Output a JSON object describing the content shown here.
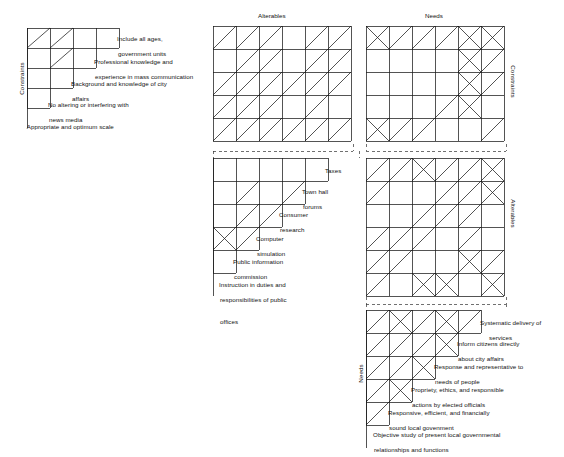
{
  "figure": {
    "type": "interaction-matrix-diagram",
    "title_top_middle": "Alterables",
    "title_top_right": "Needs"
  },
  "axis_labels": {
    "constraints_left": "Constraints",
    "constraints_right": "Constraints",
    "alterables_right": "Alterables",
    "needs_left": "Needs"
  },
  "blocks": {
    "constraints_self": {
      "name": "Constraints × Constraints",
      "shape": "staircase",
      "rows": 5,
      "cols": 4,
      "cell_w": 23,
      "cell_h": 20,
      "row_cell_counts": [
        4,
        3,
        2,
        1,
        0
      ],
      "marks": [
        {
          "row": 0,
          "col": 0,
          "type": "diagonal-up"
        },
        {
          "row": 0,
          "col": 1,
          "type": "diagonal-up"
        },
        {
          "row": 1,
          "col": 1,
          "type": "diagonal-up"
        }
      ],
      "labels": [
        {
          "line1": "Include all ages,",
          "line2": "government units"
        },
        {
          "line1": "Professional knowledge and",
          "line2": "experience in mass communication"
        },
        {
          "line1": "Background and knowledge of city",
          "line2": "affairs"
        },
        {
          "line1": "No altering or interfering with",
          "line2": "news media"
        },
        {
          "line1": "Appropriate and optimum scale",
          "line2": ""
        }
      ]
    },
    "alterables_by_constraints": {
      "name": "Alterables × Constraints",
      "shape": "full-grid",
      "rows": 5,
      "cols": 6,
      "cell_w": 23,
      "cell_h": 23,
      "marks": [
        {
          "row": 0,
          "col": 0,
          "type": "diagonal-up"
        },
        {
          "row": 0,
          "col": 1,
          "type": "diagonal-up"
        },
        {
          "row": 0,
          "col": 2,
          "type": "diagonal-up"
        },
        {
          "row": 0,
          "col": 4,
          "type": "diagonal-up"
        },
        {
          "row": 0,
          "col": 5,
          "type": "diagonal-up"
        },
        {
          "row": 1,
          "col": 1,
          "type": "diagonal-up"
        },
        {
          "row": 1,
          "col": 2,
          "type": "diagonal-up"
        },
        {
          "row": 1,
          "col": 4,
          "type": "diagonal-up"
        },
        {
          "row": 1,
          "col": 5,
          "type": "diagonal-up"
        },
        {
          "row": 2,
          "col": 0,
          "type": "diagonal-up"
        },
        {
          "row": 2,
          "col": 1,
          "type": "diagonal-up"
        },
        {
          "row": 2,
          "col": 2,
          "type": "diagonal-up"
        },
        {
          "row": 2,
          "col": 3,
          "type": "diagonal-up"
        },
        {
          "row": 2,
          "col": 4,
          "type": "diagonal-up"
        },
        {
          "row": 2,
          "col": 5,
          "type": "diagonal-up"
        },
        {
          "row": 3,
          "col": 0,
          "type": "diagonal-up"
        },
        {
          "row": 3,
          "col": 1,
          "type": "diagonal-up"
        },
        {
          "row": 3,
          "col": 2,
          "type": "diagonal-up"
        },
        {
          "row": 3,
          "col": 4,
          "type": "diagonal-up"
        },
        {
          "row": 4,
          "col": 0,
          "type": "diagonal-up"
        },
        {
          "row": 4,
          "col": 1,
          "type": "diagonal-up"
        },
        {
          "row": 4,
          "col": 2,
          "type": "diagonal-up"
        },
        {
          "row": 4,
          "col": 3,
          "type": "diagonal-up"
        },
        {
          "row": 4,
          "col": 4,
          "type": "diagonal-up"
        },
        {
          "row": 4,
          "col": 5,
          "type": "diagonal-up"
        }
      ]
    },
    "needs_by_constraints": {
      "name": "Needs × Constraints",
      "shape": "full-grid",
      "rows": 5,
      "cols": 6,
      "cell_w": 23,
      "cell_h": 23,
      "marks": [
        {
          "row": 0,
          "col": 0,
          "type": "cross"
        },
        {
          "row": 0,
          "col": 1,
          "type": "diagonal-up"
        },
        {
          "row": 0,
          "col": 2,
          "type": "diagonal-up"
        },
        {
          "row": 0,
          "col": 3,
          "type": "diagonal-up"
        },
        {
          "row": 0,
          "col": 4,
          "type": "cross"
        },
        {
          "row": 0,
          "col": 5,
          "type": "cross"
        },
        {
          "row": 1,
          "col": 4,
          "type": "cross"
        },
        {
          "row": 1,
          "col": 5,
          "type": "diagonal-up"
        },
        {
          "row": 2,
          "col": 4,
          "type": "cross"
        },
        {
          "row": 2,
          "col": 5,
          "type": "diagonal-up"
        },
        {
          "row": 3,
          "col": 3,
          "type": "diagonal-up"
        },
        {
          "row": 3,
          "col": 4,
          "type": "cross"
        },
        {
          "row": 4,
          "col": 0,
          "type": "cross"
        },
        {
          "row": 4,
          "col": 1,
          "type": "diagonal-up"
        },
        {
          "row": 4,
          "col": 2,
          "type": "diagonal-up"
        },
        {
          "row": 4,
          "col": 5,
          "type": "diagonal-up"
        }
      ]
    },
    "alterables_self": {
      "name": "Alterables × Alterables",
      "shape": "staircase",
      "rows": 6,
      "cols": 5,
      "cell_w": 23,
      "cell_h": 23,
      "row_cell_counts": [
        5,
        4,
        3,
        2,
        1,
        0
      ],
      "marks": [
        {
          "row": 1,
          "col": 1,
          "type": "diagonal-up"
        },
        {
          "row": 1,
          "col": 3,
          "type": "diagonal-up"
        },
        {
          "row": 2,
          "col": 1,
          "type": "diagonal-up"
        },
        {
          "row": 2,
          "col": 2,
          "type": "diagonal-up"
        },
        {
          "row": 3,
          "col": 0,
          "type": "cross"
        },
        {
          "row": 3,
          "col": 1,
          "type": "diagonal-up"
        }
      ],
      "labels": [
        {
          "line1": "Taxes",
          "line2": ""
        },
        {
          "line1": "Town hall",
          "line2": "forums"
        },
        {
          "line1": "Consumer",
          "line2": "research"
        },
        {
          "line1": "Computer",
          "line2": "simulation"
        },
        {
          "line1": "Public information",
          "line2": "commission"
        },
        {
          "line1": "Instruction in duties and",
          "line2": "responsibilities of public",
          "line3": "offices"
        }
      ]
    },
    "needs_by_alterables": {
      "name": "Needs × Alterables",
      "shape": "full-grid",
      "rows": 6,
      "cols": 6,
      "cell_w": 23,
      "cell_h": 23,
      "marks": [
        {
          "row": 0,
          "col": 0,
          "type": "diagonal-up"
        },
        {
          "row": 0,
          "col": 1,
          "type": "diagonal-up"
        },
        {
          "row": 0,
          "col": 2,
          "type": "cross"
        },
        {
          "row": 0,
          "col": 3,
          "type": "diagonal-up"
        },
        {
          "row": 0,
          "col": 4,
          "type": "diagonal-up"
        },
        {
          "row": 0,
          "col": 5,
          "type": "cross"
        },
        {
          "row": 1,
          "col": 0,
          "type": "diagonal-up"
        },
        {
          "row": 1,
          "col": 3,
          "type": "diagonal-up"
        },
        {
          "row": 1,
          "col": 4,
          "type": "diagonal-up"
        },
        {
          "row": 1,
          "col": 5,
          "type": "cross"
        },
        {
          "row": 2,
          "col": 2,
          "type": "diagonal-up"
        },
        {
          "row": 2,
          "col": 3,
          "type": "diagonal-up"
        },
        {
          "row": 2,
          "col": 4,
          "type": "diagonal-up"
        },
        {
          "row": 3,
          "col": 0,
          "type": "diagonal-up"
        },
        {
          "row": 3,
          "col": 1,
          "type": "diagonal-up"
        },
        {
          "row": 3,
          "col": 2,
          "type": "diagonal-up"
        },
        {
          "row": 3,
          "col": 4,
          "type": "diagonal-up"
        },
        {
          "row": 4,
          "col": 0,
          "type": "diagonal-up"
        },
        {
          "row": 4,
          "col": 1,
          "type": "diagonal-up"
        },
        {
          "row": 4,
          "col": 4,
          "type": "cross"
        },
        {
          "row": 4,
          "col": 5,
          "type": "diagonal-up"
        },
        {
          "row": 5,
          "col": 0,
          "type": "diagonal-up"
        },
        {
          "row": 5,
          "col": 2,
          "type": "cross"
        },
        {
          "row": 5,
          "col": 3,
          "type": "cross"
        },
        {
          "row": 5,
          "col": 5,
          "type": "cross"
        }
      ]
    },
    "needs_self": {
      "name": "Needs × Needs",
      "shape": "staircase",
      "rows": 6,
      "cols": 5,
      "cell_w": 23,
      "cell_h": 23,
      "row_cell_counts": [
        5,
        4,
        3,
        2,
        1,
        0
      ],
      "marks": [
        {
          "row": 0,
          "col": 0,
          "type": "diagonal-up"
        },
        {
          "row": 0,
          "col": 1,
          "type": "cross"
        },
        {
          "row": 0,
          "col": 2,
          "type": "diagonal-up"
        },
        {
          "row": 0,
          "col": 3,
          "type": "cross"
        },
        {
          "row": 0,
          "col": 4,
          "type": "diagonal-up"
        },
        {
          "row": 1,
          "col": 0,
          "type": "diagonal-up"
        },
        {
          "row": 1,
          "col": 1,
          "type": "diagonal-up"
        },
        {
          "row": 1,
          "col": 2,
          "type": "diagonal-up"
        },
        {
          "row": 1,
          "col": 3,
          "type": "cross"
        },
        {
          "row": 2,
          "col": 0,
          "type": "diagonal-up"
        },
        {
          "row": 2,
          "col": 1,
          "type": "diagonal-up"
        },
        {
          "row": 2,
          "col": 2,
          "type": "cross"
        },
        {
          "row": 3,
          "col": 0,
          "type": "diagonal-up"
        },
        {
          "row": 3,
          "col": 1,
          "type": "cross"
        },
        {
          "row": 4,
          "col": 0,
          "type": "diagonal-up"
        }
      ],
      "labels": [
        {
          "line1": "Systematic delivery of",
          "line2": "services"
        },
        {
          "line1": "Inform citizens directly",
          "line2": "about city affairs"
        },
        {
          "line1": "Response and representative to",
          "line2": "needs of people"
        },
        {
          "line1": "Propriety, ethics, and responsible",
          "line2": "actions by elected officials"
        },
        {
          "line1": "Responsive, efficient, and financially",
          "line2": "sound local govenment"
        },
        {
          "line1": "Objective study of present local governmental",
          "line2": "relationships and functions"
        }
      ]
    }
  }
}
